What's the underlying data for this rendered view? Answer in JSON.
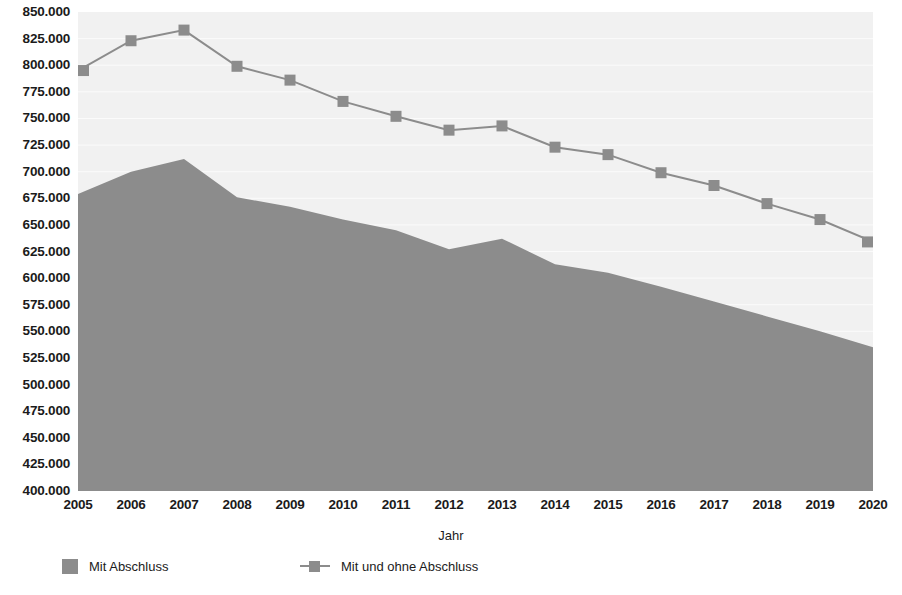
{
  "chart_data": {
    "type": "area",
    "title": "",
    "xlabel": "Jahr",
    "ylabel": "",
    "categories": [
      "2005",
      "2006",
      "2007",
      "2008",
      "2009",
      "2010",
      "2011",
      "2012",
      "2013",
      "2014",
      "2015",
      "2016",
      "2017",
      "2018",
      "2019",
      "2020"
    ],
    "x": [
      2005,
      2006,
      2007,
      2008,
      2009,
      2010,
      2011,
      2012,
      2013,
      2014,
      2015,
      2016,
      2017,
      2018,
      2019,
      2020
    ],
    "series": [
      {
        "name": "Mit Abschluss",
        "render": "area",
        "color": "#8c8c8c",
        "values": [
          679000,
          700000,
          712000,
          676000,
          667000,
          655000,
          645000,
          627000,
          637000,
          613000,
          605000,
          592000,
          578000,
          564000,
          550000,
          535000
        ]
      },
      {
        "name": "Mit und ohne Abschluss",
        "render": "line-marker",
        "color": "#8c8c8c",
        "values": [
          795000,
          823000,
          833000,
          799000,
          786000,
          766000,
          752000,
          739000,
          743000,
          723000,
          716000,
          699000,
          687000,
          670000,
          655000,
          634000
        ]
      }
    ],
    "ylim": [
      400000,
      850000
    ],
    "ytick_step": 25000,
    "ytick_labels": [
      "850.000",
      "825.000",
      "800.000",
      "775.000",
      "750.000",
      "725.000",
      "700.000",
      "675.000",
      "650.000",
      "625.000",
      "600.000",
      "575.000",
      "550.000",
      "525.000",
      "500.000",
      "475.000",
      "450.000",
      "425.000",
      "400.000"
    ],
    "ytick_values": [
      850000,
      825000,
      800000,
      775000,
      750000,
      725000,
      700000,
      675000,
      650000,
      625000,
      600000,
      575000,
      550000,
      525000,
      500000,
      475000,
      450000,
      425000,
      400000
    ],
    "grid": true,
    "grid_axis": "y",
    "legend_position": "bottom",
    "legend": [
      "Mit Abschluss",
      "Mit und ohne Abschluss"
    ],
    "plot_background": "#f1f1f1",
    "page_background": "#ffffff"
  },
  "axis": {
    "x_title": "Jahr"
  },
  "legend": {
    "items": [
      {
        "label": "Mit Abschluss"
      },
      {
        "label": "Mit und ohne Abschluss"
      }
    ]
  }
}
